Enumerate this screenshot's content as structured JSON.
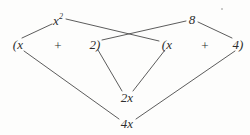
{
  "figure": {
    "expression": "(x + 2)(x + 4)",
    "background_color": "#fdfdfc",
    "ink_color": "#3a3a3a",
    "terms": [
      {
        "id": "left-open-x",
        "text": "(x",
        "x": 18,
        "y": 44
      },
      {
        "id": "left-plus",
        "text": "+",
        "x": 58,
        "y": 45
      },
      {
        "id": "left-two",
        "text": "2)",
        "x": 95,
        "y": 44
      },
      {
        "id": "right-open-x",
        "text": "(x",
        "x": 167,
        "y": 44
      },
      {
        "id": "right-plus",
        "text": "+",
        "x": 205,
        "y": 45
      },
      {
        "id": "right-four",
        "text": "4)",
        "x": 238,
        "y": 44
      }
    ],
    "products": [
      {
        "id": "first",
        "label": "x",
        "exponent": "2",
        "x": 58,
        "y": 20
      },
      {
        "id": "outer",
        "label": "8",
        "exponent": "",
        "x": 192,
        "y": 19
      },
      {
        "id": "inner",
        "label": "2x",
        "exponent": "",
        "x": 127,
        "y": 97
      },
      {
        "id": "last",
        "label": "4x",
        "exponent": "",
        "x": 127,
        "y": 123
      }
    ],
    "connectors": [
      {
        "id": "first-left",
        "from": "left-open-x",
        "to": "x-squared",
        "x1": 22,
        "y1": 38,
        "x2": 52,
        "y2": 24
      },
      {
        "id": "first-right",
        "from": "x-squared",
        "to": "right-x",
        "x1": 66,
        "y1": 19,
        "x2": 159,
        "y2": 41
      },
      {
        "id": "outer-left",
        "from": "two",
        "to": "eight",
        "x1": 102,
        "y1": 40,
        "x2": 186,
        "y2": 21
      },
      {
        "id": "outer-right",
        "from": "eight",
        "to": "four",
        "x1": 198,
        "y1": 22,
        "x2": 232,
        "y2": 38
      },
      {
        "id": "inner-left",
        "from": "two",
        "to": "2x",
        "x1": 98,
        "y1": 50,
        "x2": 122,
        "y2": 91
      },
      {
        "id": "inner-right",
        "from": "right-x",
        "to": "2x",
        "x1": 165,
        "y1": 50,
        "x2": 133,
        "y2": 91
      },
      {
        "id": "last-left",
        "from": "left-open-x",
        "to": "4x",
        "x1": 24,
        "y1": 51,
        "x2": 119,
        "y2": 119
      },
      {
        "id": "last-right",
        "from": "4x",
        "to": "four",
        "x1": 136,
        "y1": 119,
        "x2": 235,
        "y2": 51
      }
    ],
    "speck": {
      "x": 222,
      "y": 9
    }
  }
}
